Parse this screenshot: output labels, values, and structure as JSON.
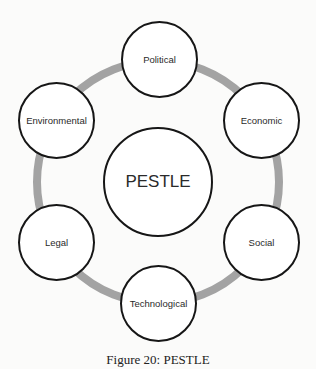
{
  "diagram": {
    "title": "PESTLE",
    "ring_color": "#a3a3a3",
    "outline_color": "#161616",
    "nodes": [
      {
        "id": "political",
        "label": "Political",
        "cx": 159,
        "cy": 59
      },
      {
        "id": "economic",
        "label": "Economic",
        "cx": 262,
        "cy": 121
      },
      {
        "id": "social",
        "label": "Social",
        "cx": 261,
        "cy": 242
      },
      {
        "id": "technological",
        "label": "Technological",
        "cx": 158,
        "cy": 303
      },
      {
        "id": "legal",
        "label": "Legal",
        "cx": 56,
        "cy": 242
      },
      {
        "id": "environmental",
        "label": "Environmental",
        "cx": 56,
        "cy": 120
      }
    ],
    "center_node": {
      "label": "PESTLE",
      "cx": 158,
      "cy": 182
    }
  },
  "caption": "Figure 20: PESTLE"
}
